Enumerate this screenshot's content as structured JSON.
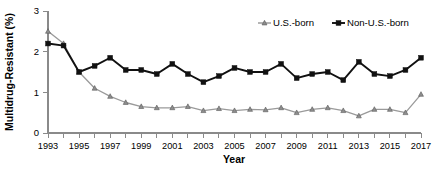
{
  "chart_data": {
    "type": "line",
    "title": "",
    "xlabel": "Year",
    "ylabel": "Multidrug-Resistant (%)",
    "x": [
      1993,
      1994,
      1995,
      1996,
      1997,
      1998,
      1999,
      2000,
      2001,
      2002,
      2003,
      2004,
      2005,
      2006,
      2007,
      2008,
      2009,
      2010,
      2011,
      2012,
      2013,
      2014,
      2015,
      2016,
      2017
    ],
    "xlim": [
      1993,
      2017
    ],
    "ylim": [
      0,
      3
    ],
    "yticks": [
      0,
      1,
      2,
      3
    ],
    "xticks": [
      1993,
      1995,
      1997,
      1999,
      2001,
      2003,
      2005,
      2007,
      2009,
      2011,
      2013,
      2015,
      2017
    ],
    "xtick_labels": [
      "1993",
      "1995",
      "1997",
      "1999",
      "2001",
      "2003",
      "2005",
      "2007",
      "2009",
      "2011",
      "2013",
      "2015",
      "2017"
    ],
    "ytick_labels": [
      "0",
      "1",
      "2",
      "3"
    ],
    "grid": false,
    "legend_position": "top-right",
    "series": [
      {
        "name": "U.S.-born",
        "marker": "triangle",
        "color": "#8d8d8d",
        "values": [
          2.5,
          2.2,
          1.5,
          1.1,
          0.9,
          0.75,
          0.65,
          0.62,
          0.62,
          0.65,
          0.55,
          0.6,
          0.55,
          0.58,
          0.57,
          0.62,
          0.5,
          0.58,
          0.62,
          0.55,
          0.42,
          0.58,
          0.58,
          0.5,
          0.95
        ]
      },
      {
        "name": "Non-U.S.-born",
        "marker": "square",
        "color": "#111111",
        "values": [
          2.2,
          2.15,
          1.5,
          1.65,
          1.85,
          1.55,
          1.55,
          1.45,
          1.7,
          1.45,
          1.25,
          1.4,
          1.6,
          1.5,
          1.5,
          1.7,
          1.35,
          1.45,
          1.5,
          1.3,
          1.75,
          1.45,
          1.4,
          1.55,
          1.85
        ]
      }
    ]
  },
  "axes": {
    "y_title": "Multidrug-Resistant (%)",
    "x_title": "Year"
  },
  "legend": {
    "items": [
      {
        "label": "U.S.-born",
        "marker": "triangle",
        "color": "#8d8d8d"
      },
      {
        "label": "Non-U.S.-born",
        "marker": "square",
        "color": "#111111"
      }
    ]
  }
}
